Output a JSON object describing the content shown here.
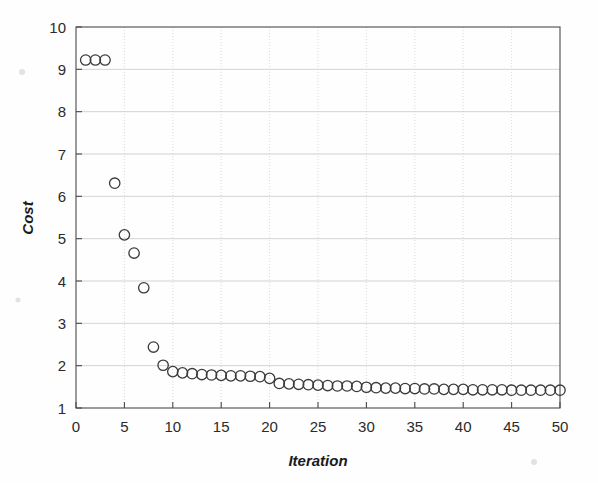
{
  "figure": {
    "background_color": "#fefefe",
    "marker_color": "#3a3a3a",
    "grid_color": "#c8c8c8",
    "axis_color": "#4a4a4a",
    "marker_shape": "open-circle"
  },
  "chart_data": {
    "type": "scatter",
    "title": "",
    "xlabel": "Iteration",
    "ylabel": "Cost",
    "xlim": [
      0,
      50
    ],
    "ylim": [
      1,
      10
    ],
    "xticks": [
      0,
      5,
      10,
      15,
      20,
      25,
      30,
      35,
      40,
      45,
      50
    ],
    "xtick_labels": [
      "0",
      "5",
      "10",
      "15",
      "20",
      "25",
      "30",
      "35",
      "40",
      "45",
      "50"
    ],
    "yticks": [
      1,
      2,
      3,
      4,
      5,
      6,
      7,
      8,
      9,
      10
    ],
    "ytick_labels": [
      "1",
      "2",
      "3",
      "4",
      "5",
      "6",
      "7",
      "8",
      "9",
      "10"
    ],
    "grid": true,
    "legend": null,
    "marker": "o",
    "series": [
      {
        "name": "cost",
        "x": [
          1,
          2,
          3,
          4,
          5,
          6,
          7,
          8,
          9,
          10,
          11,
          12,
          13,
          14,
          15,
          16,
          17,
          18,
          19,
          20,
          21,
          22,
          23,
          24,
          25,
          26,
          27,
          28,
          29,
          30,
          31,
          32,
          33,
          34,
          35,
          36,
          37,
          38,
          39,
          40,
          41,
          42,
          43,
          44,
          45,
          46,
          47,
          48,
          49,
          50
        ],
        "y": [
          9.22,
          9.22,
          9.22,
          6.31,
          5.09,
          4.66,
          3.84,
          2.44,
          2.01,
          1.86,
          1.83,
          1.81,
          1.79,
          1.78,
          1.77,
          1.76,
          1.76,
          1.75,
          1.74,
          1.7,
          1.58,
          1.57,
          1.56,
          1.55,
          1.54,
          1.53,
          1.52,
          1.52,
          1.51,
          1.49,
          1.48,
          1.47,
          1.47,
          1.46,
          1.46,
          1.45,
          1.45,
          1.44,
          1.44,
          1.44,
          1.43,
          1.43,
          1.43,
          1.43,
          1.42,
          1.42,
          1.42,
          1.42,
          1.42,
          1.42
        ]
      }
    ]
  }
}
